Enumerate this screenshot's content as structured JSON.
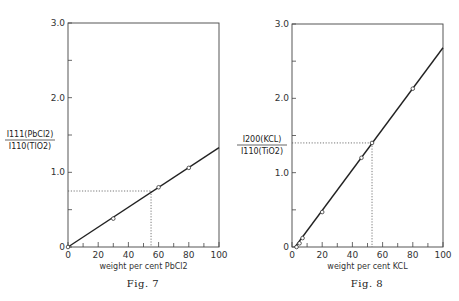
{
  "chart_data": [
    {
      "type": "line",
      "caption": "Fig. 7",
      "title": "",
      "xlabel": "weight per cent PbCl2",
      "ylabel": "I111(PbCl2) / I110(TlO2)",
      "ylabel_num": "I111(PbCl2)",
      "ylabel_den": "I110(TlO2)",
      "xlim": [
        0,
        100
      ],
      "ylim": [
        0,
        3.0
      ],
      "xticks": [
        "0",
        "20",
        "40",
        "60",
        "80",
        "100"
      ],
      "yticks": [
        "0",
        "1.0",
        "2.0",
        "3.0"
      ],
      "series": [
        {
          "name": "measured",
          "x": [
            0,
            30,
            60,
            80
          ],
          "y": [
            0.0,
            0.38,
            0.8,
            1.06
          ],
          "marker": "open-circle"
        },
        {
          "name": "fit line",
          "x": [
            0,
            100
          ],
          "y": [
            0.0,
            1.33
          ],
          "style": "solid"
        }
      ],
      "annotations": [
        {
          "type": "dotted-guide",
          "x": 55,
          "y": 0.75
        }
      ],
      "grid": false
    },
    {
      "type": "line",
      "caption": "Fig. 8",
      "title": "",
      "xlabel": "weight per cent KCL",
      "ylabel": "I200(KCL) / I110(TiO2)",
      "ylabel_num": "I200(KCL)",
      "ylabel_den": "I110(TiO2)",
      "xlim": [
        0,
        100
      ],
      "ylim": [
        0,
        3.0
      ],
      "xticks": [
        "0",
        "20",
        "40",
        "60",
        "80",
        "100"
      ],
      "yticks": [
        "0",
        "1.0",
        "2.0",
        "3.0"
      ],
      "series": [
        {
          "name": "measured",
          "x": [
            3,
            5,
            7,
            20,
            46,
            53,
            80
          ],
          "y": [
            0.0,
            0.05,
            0.12,
            0.47,
            1.2,
            1.4,
            2.13
          ],
          "marker": "open-circle"
        },
        {
          "name": "fit line",
          "x": [
            2,
            100
          ],
          "y": [
            0.0,
            2.68
          ],
          "style": "solid"
        }
      ],
      "annotations": [
        {
          "type": "dotted-guide",
          "x": 53,
          "y": 1.4
        }
      ],
      "grid": false
    }
  ]
}
